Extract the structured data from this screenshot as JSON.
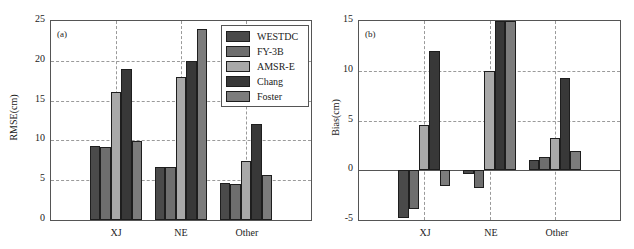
{
  "chart_data": [
    {
      "type": "bar",
      "panel_label": "(a)",
      "title": "",
      "xlabel": "",
      "ylabel": "RMSE(cm)",
      "categories": [
        "XJ",
        "NE",
        "Other"
      ],
      "ylim": [
        0,
        25
      ],
      "yticks": [
        0,
        5,
        10,
        15,
        20,
        25
      ],
      "grid": true,
      "legend_position": "upper right",
      "series": [
        {
          "name": "WESTDC",
          "color": "#4a4a4a",
          "values": [
            9.3,
            6.6,
            4.7
          ]
        },
        {
          "name": "FY-3B",
          "color": "#6e6e6e",
          "values": [
            9.2,
            6.7,
            4.5
          ]
        },
        {
          "name": "AMSR-E",
          "color": "#a9a9a9",
          "values": [
            16.1,
            18.0,
            7.4
          ]
        },
        {
          "name": "Chang",
          "color": "#383838",
          "values": [
            19.0,
            20.0,
            12.0
          ]
        },
        {
          "name": "Foster",
          "color": "#7c7c7c",
          "values": [
            9.9,
            24.0,
            5.7
          ]
        }
      ]
    },
    {
      "type": "bar",
      "panel_label": "(b)",
      "title": "",
      "xlabel": "",
      "ylabel": "Bias(cm)",
      "categories": [
        "XJ",
        "NE",
        "Other"
      ],
      "ylim": [
        -5,
        15
      ],
      "yticks": [
        -5,
        0,
        5,
        10,
        15
      ],
      "grid": true,
      "legend_position": "none",
      "series": [
        {
          "name": "WESTDC",
          "color": "#4a4a4a",
          "values": [
            -4.8,
            -0.4,
            1.0
          ]
        },
        {
          "name": "FY-3B",
          "color": "#6e6e6e",
          "values": [
            -3.9,
            -1.8,
            1.3
          ]
        },
        {
          "name": "AMSR-E",
          "color": "#a9a9a9",
          "values": [
            4.5,
            10.0,
            3.2
          ]
        },
        {
          "name": "Chang",
          "color": "#383838",
          "values": [
            12.0,
            15.0,
            9.3
          ]
        },
        {
          "name": "Foster",
          "color": "#7c7c7c",
          "values": [
            -1.6,
            15.0,
            1.9
          ]
        }
      ]
    }
  ],
  "panels": {
    "a": {
      "label": "(a)",
      "ylabel": "RMSE(cm)",
      "yticks": [
        "0",
        "5",
        "10",
        "15",
        "20",
        "25"
      ],
      "xticks": [
        "XJ",
        "NE",
        "Other"
      ]
    },
    "b": {
      "label": "(b)",
      "ylabel": "Bias(cm)",
      "yticks": [
        "-5",
        "0",
        "5",
        "10",
        "15"
      ],
      "xticks": [
        "XJ",
        "NE",
        "Other"
      ]
    }
  },
  "legend": {
    "items": [
      {
        "label": "WESTDC",
        "color": "#4a4a4a"
      },
      {
        "label": "FY-3B",
        "color": "#6e6e6e"
      },
      {
        "label": "AMSR-E",
        "color": "#a9a9a9"
      },
      {
        "label": "Chang",
        "color": "#383838"
      },
      {
        "label": "Foster",
        "color": "#7c7c7c"
      }
    ]
  }
}
